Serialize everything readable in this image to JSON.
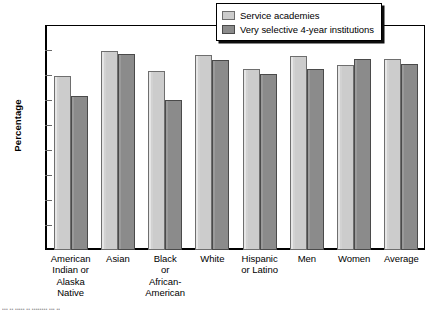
{
  "chart_data": {
    "type": "bar",
    "title": "",
    "subtitle": "",
    "xlabel": "",
    "ylabel": "Percentage",
    "ylim": [
      0,
      90
    ],
    "yticks": [
      0,
      10,
      20,
      30,
      40,
      50,
      60,
      70,
      80,
      90
    ],
    "ytick_labels": [
      "0",
      "10",
      "20",
      "30",
      "40",
      "50",
      "60",
      "70",
      "80",
      "90"
    ],
    "grid": false,
    "legend_position": "top-right",
    "categories": [
      "American Indian or Alaska Native",
      "Asian",
      "Black or African-American",
      "White",
      "Hispanic or Latino",
      "Men",
      "Women",
      "Average"
    ],
    "category_label_lines": [
      [
        "American",
        "Indian or",
        "Alaska",
        "Native"
      ],
      [
        "Asian"
      ],
      [
        "Black",
        "or",
        "African-",
        "American"
      ],
      [
        "White"
      ],
      [
        "Hispanic",
        "or Latino"
      ],
      [
        "Men"
      ],
      [
        "Women"
      ],
      [
        "Average"
      ]
    ],
    "series": [
      {
        "name": "Service academies",
        "color": "#cccccc",
        "values": [
          69.5,
          79.5,
          71.5,
          78.0,
          72.5,
          77.5,
          74.0,
          76.5
        ]
      },
      {
        "name": "Very selective 4-year institutions",
        "color": "#8b8b8b",
        "values": [
          61.5,
          78.5,
          60.0,
          76.0,
          70.5,
          72.5,
          76.5,
          74.5
        ]
      }
    ]
  },
  "legend": {
    "items": [
      {
        "label": "Service academies",
        "swatch": "light"
      },
      {
        "label": "Very selective 4-year institutions",
        "swatch": "dark"
      }
    ]
  },
  "footer": {
    "clipped_text": "••• •• ••••• •• •••••••• ••• ••"
  }
}
